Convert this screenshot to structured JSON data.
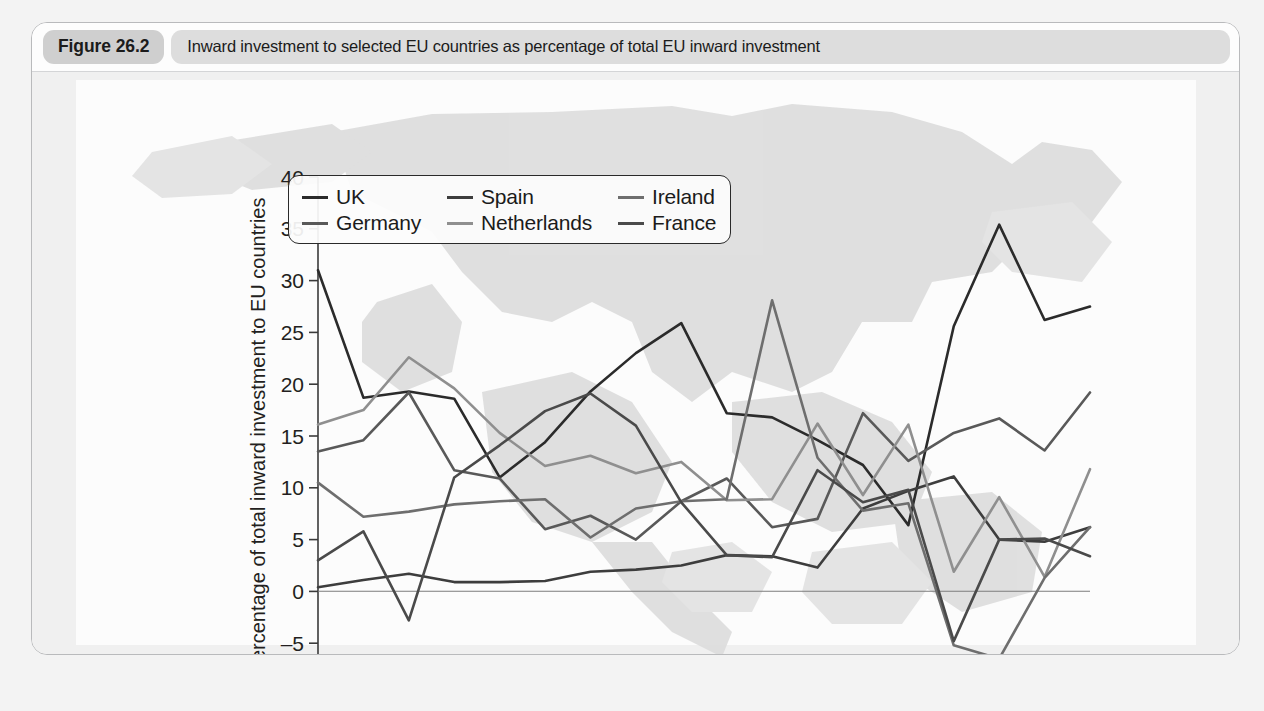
{
  "figure": {
    "badge": "Figure 26.2",
    "caption": "Inward investment to selected EU countries as percentage of total EU inward investment"
  },
  "chart_data": {
    "type": "line",
    "title": "Inward investment to selected EU countries as percentage of total EU inward investment",
    "xlabel": "",
    "ylabel": "Percentage of total inward investment to EU countries",
    "xlim": [
      1990,
      2007
    ],
    "ylim": [
      -10,
      40
    ],
    "yticks": [
      -10,
      -5,
      0,
      5,
      10,
      15,
      20,
      25,
      30,
      35,
      40
    ],
    "ytick_labels": [
      "–10",
      "–5",
      "0",
      "5",
      "10",
      "15",
      "20",
      "25",
      "30",
      "35",
      "40"
    ],
    "xticks": [
      1990,
      1991,
      1992,
      1993,
      1994,
      1995,
      1996,
      1997,
      1998,
      1999,
      2000,
      2001,
      2002,
      2003,
      2004,
      2005,
      2006,
      2007
    ],
    "xtick_labels": [
      "1990",
      "",
      "1992",
      "",
      "1994",
      "",
      "1996",
      "",
      "1998",
      "",
      "2000",
      "",
      "2002",
      "",
      "2004",
      "",
      "2006",
      ""
    ],
    "grid": false,
    "legend_position": "top-left",
    "zero_line": true,
    "x": [
      1990,
      1991,
      1992,
      1993,
      1994,
      1995,
      1996,
      1997,
      1998,
      1999,
      2000,
      2001,
      2002,
      2003,
      2004,
      2005,
      2006,
      2007
    ],
    "series": [
      {
        "name": "UK",
        "color": "#2b2b2b",
        "values": [
          31.0,
          18.7,
          19.3,
          18.6,
          11.0,
          14.4,
          19.3,
          23.0,
          25.9,
          17.2,
          16.8,
          14.6,
          12.2,
          6.4,
          25.6,
          35.4,
          26.2,
          27.5
        ]
      },
      {
        "name": "Germany",
        "color": "#595959",
        "values": [
          13.5,
          14.6,
          19.2,
          11.7,
          10.9,
          6.0,
          7.3,
          5.0,
          8.7,
          10.9,
          6.2,
          7.0,
          17.2,
          12.6,
          15.3,
          16.7,
          13.6,
          19.2
        ]
      },
      {
        "name": "Spain",
        "color": "#3d3d3d",
        "values": [
          0.4,
          1.1,
          1.7,
          0.9,
          0.9,
          1.0,
          1.9,
          2.1,
          2.5,
          3.5,
          3.4,
          2.3,
          8.0,
          9.7,
          11.1,
          5.0,
          4.8,
          6.2
        ]
      },
      {
        "name": "Netherlands",
        "color": "#8f8f8f",
        "values": [
          16.1,
          17.5,
          22.6,
          19.6,
          15.3,
          12.1,
          13.1,
          11.4,
          12.5,
          8.8,
          8.9,
          16.2,
          9.3,
          16.1,
          1.9,
          9.1,
          1.4,
          11.8
        ]
      },
      {
        "name": "Ireland",
        "color": "#6e6e6e",
        "values": [
          10.5,
          7.2,
          7.7,
          8.4,
          8.7,
          8.9,
          5.2,
          8.0,
          8.7,
          8.9,
          28.1,
          12.9,
          7.8,
          8.5,
          -5.2,
          -6.5,
          1.3,
          6.2
        ]
      },
      {
        "name": "France",
        "color": "#4a4a4a",
        "values": [
          3.0,
          5.8,
          -2.8,
          11.0,
          14.1,
          17.4,
          19.1,
          16.0,
          8.6,
          3.5,
          3.3,
          11.7,
          8.6,
          9.8,
          -4.8,
          5.0,
          5.1,
          3.4
        ]
      }
    ]
  },
  "legend": {
    "items": [
      {
        "label": "UK",
        "color": "#2b2b2b"
      },
      {
        "label": "Spain",
        "color": "#3d3d3d"
      },
      {
        "label": "Ireland",
        "color": "#6e6e6e"
      },
      {
        "label": "Germany",
        "color": "#595959"
      },
      {
        "label": "Netherlands",
        "color": "#8f8f8f"
      },
      {
        "label": "France",
        "color": "#4a4a4a"
      }
    ]
  }
}
